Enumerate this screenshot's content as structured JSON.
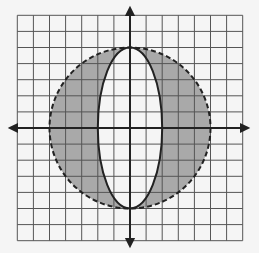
{
  "figure": {
    "grid": {
      "xmin": -7,
      "xmax": 7,
      "ymin": -7,
      "ymax": 7,
      "step": 1
    },
    "circle": {
      "cx": 0,
      "cy": 0,
      "r": 5,
      "style": "dashed"
    },
    "ellipse": {
      "cx": 0,
      "cy": 0,
      "rx": 2,
      "ry": 5,
      "style": "solid"
    },
    "shaded_region": "inside circle, outside ellipse",
    "colors": {
      "background": "#f5f5f5",
      "grid": "#555555",
      "shade": "#a9a9a9",
      "axis": "#222222",
      "curve": "#222222"
    }
  }
}
